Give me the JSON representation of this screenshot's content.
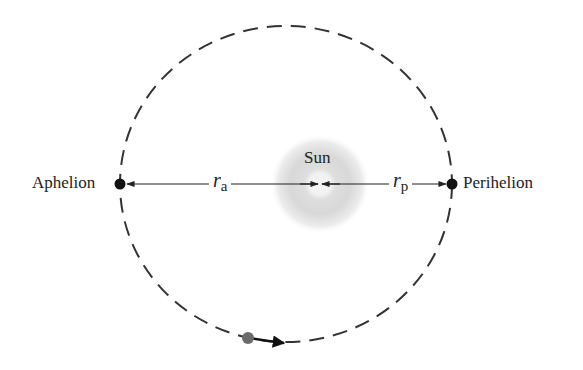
{
  "diagram": {
    "labels": {
      "sun": "Sun",
      "aphelion": "Aphelion",
      "perihelion": "Perihelion",
      "ra_var": "r",
      "ra_sub": "a",
      "rp_var": "r",
      "rp_sub": "p"
    },
    "geometry": {
      "orbit_center": [
        286,
        184
      ],
      "orbit_rx": 166,
      "orbit_ry": 158,
      "sun_center": [
        320,
        184
      ],
      "aphelion_point": [
        120,
        184
      ],
      "perihelion_point": [
        452,
        184
      ],
      "planet_point": [
        248,
        338
      ]
    },
    "colors": {
      "orbit_stroke": "#333333",
      "line_stroke": "#222222",
      "point_fill": "#111111",
      "planet_fill": "#6b6b6b",
      "sun_glow": "#cfcfcf",
      "sun_core": "#f4f4f4",
      "text": "#222222"
    }
  }
}
